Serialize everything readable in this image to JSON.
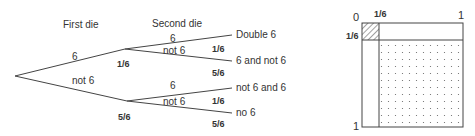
{
  "tree": {
    "headers": {
      "first_die": "First die",
      "second_die": "Second die"
    },
    "first_branches": [
      {
        "label": "6",
        "prob": "1/6"
      },
      {
        "label": "not 6",
        "prob": "5/6"
      }
    ],
    "second_branches": [
      {
        "label": "6",
        "prob": "1/6",
        "outcome": "Double 6"
      },
      {
        "label": "not 6",
        "prob": "5/6",
        "outcome": "6 and not 6"
      },
      {
        "label": "6",
        "prob": "1/6",
        "outcome": "not 6 and 6"
      },
      {
        "label": "not 6",
        "prob": "5/6",
        "outcome": "no 6"
      }
    ]
  },
  "area_diagram": {
    "top_left": "0",
    "top_split": "1/6",
    "top_right": "1",
    "left_split": "1/6",
    "bottom_left": "1",
    "regions": [
      "hatched: double 6 (1/6 × 1/6)",
      "dotted: no 6 (5/6 × 5/6)"
    ]
  }
}
